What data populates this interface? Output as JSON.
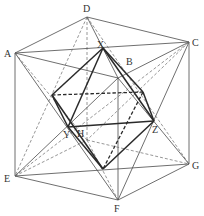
{
  "diagram": {
    "title": "",
    "type": "cube with inscribed octahedron",
    "labels": {
      "A": "A",
      "B": "B",
      "C": "C",
      "D": "D",
      "E": "E",
      "F": "F",
      "G": "G",
      "H": "H",
      "X": "X",
      "Y": "Y",
      "Z": "Z"
    },
    "points": {
      "A": [
        15,
        53
      ],
      "C": [
        189,
        42
      ],
      "D": [
        87,
        17
      ],
      "E": [
        15,
        176
      ],
      "F": [
        118,
        200
      ],
      "G": [
        189,
        164
      ],
      "X": [
        103,
        48
      ],
      "Y": [
        68,
        127
      ],
      "Z": [
        154,
        121
      ],
      "O1": [
        52,
        95
      ],
      "O2": [
        143,
        92
      ],
      "W": [
        103,
        169
      ],
      "Bhidden": [
        87,
        140
      ]
    },
    "colors": {
      "line": "#4a4a4a",
      "bold": "#2a2a2a",
      "background": "#ffffff"
    }
  }
}
